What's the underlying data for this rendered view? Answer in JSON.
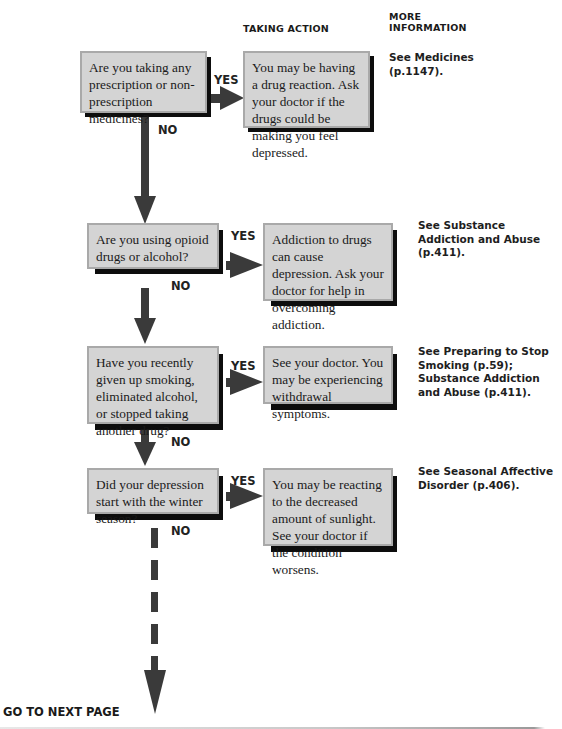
{
  "headers": {
    "taking_action": "TAKING ACTION",
    "more_information_line1": "MORE",
    "more_information_line2": "INFORMATION"
  },
  "labels": {
    "yes": "YES",
    "no": "NO"
  },
  "steps": [
    {
      "question": "Are you taking any prescription or non-prescription medicines?",
      "action": "You may be having a drug reaction. Ask your doctor if the drugs could be making you feel depressed.",
      "more_info": "See Medicines (p.1147)."
    },
    {
      "question": "Are you using opioid drugs or alcohol?",
      "action": "Addiction to drugs can cause depression. Ask your doctor for help in overcoming addiction.",
      "more_info": "See Substance Addiction and Abuse (p.411)."
    },
    {
      "question": "Have you recently given up smoking, eliminated alcohol, or stopped taking another drug?",
      "action": "See your doctor. You may be experiencing withdrawal symptoms.",
      "more_info": "See Preparing to Stop Smoking (p.59); Substance Addiction and Abuse (p.411)."
    },
    {
      "question": "Did your depression start with the winter season?",
      "action": "You may be reacting to the decreased amount of sunlight. See your doctor if the condition worsens.",
      "more_info": "See Seasonal Affective Disorder (p.406)."
    }
  ],
  "footer": {
    "go_next": "GO TO NEXT PAGE"
  },
  "colors": {
    "box_fill": "#d4d4d4",
    "box_border": "#a9a9a9",
    "shadow": "#0d0d0d",
    "arrow": "#3a3a3a"
  }
}
